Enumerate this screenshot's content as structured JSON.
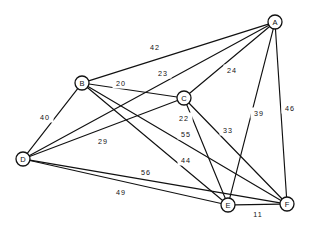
{
  "chart_data": {
    "type": "diagram",
    "title": "",
    "subtitle": "",
    "xlabel": "",
    "ylabel": "",
    "graph_kind": "undirected-weighted-graph",
    "colors": {
      "background": "#ffffff",
      "stroke": "#111111",
      "node_fill": "#ffffff",
      "text": "#111111"
    },
    "nodes": [
      {
        "id": "A",
        "label": "A",
        "x": 275,
        "y": 22,
        "r": 7
      },
      {
        "id": "B",
        "label": "B",
        "x": 82,
        "y": 83,
        "r": 7
      },
      {
        "id": "C",
        "label": "C",
        "x": 184,
        "y": 98,
        "r": 7
      },
      {
        "id": "D",
        "label": "D",
        "x": 23,
        "y": 159,
        "r": 7
      },
      {
        "id": "E",
        "label": "E",
        "x": 228,
        "y": 205,
        "r": 7
      },
      {
        "id": "F",
        "label": "F",
        "x": 287,
        "y": 204,
        "r": 7
      }
    ],
    "edges": [
      {
        "id": "AB",
        "from": "B",
        "to": "A",
        "weight": "42",
        "label_x": 155,
        "label_y": 47
      },
      {
        "id": "AD",
        "from": "D",
        "to": "A",
        "weight": "23",
        "label_x": 163,
        "label_y": 73
      },
      {
        "id": "BC",
        "from": "B",
        "to": "C",
        "weight": "20",
        "label_x": 121,
        "label_y": 83
      },
      {
        "id": "AC",
        "from": "C",
        "to": "A",
        "weight": "24",
        "label_x": 232,
        "label_y": 70
      },
      {
        "id": "BD",
        "from": "B",
        "to": "D",
        "weight": "40",
        "label_x": 45,
        "label_y": 117
      },
      {
        "id": "CE",
        "from": "C",
        "to": "E",
        "weight": "22",
        "label_x": 184,
        "label_y": 118
      },
      {
        "id": "CF",
        "from": "C",
        "to": "F",
        "weight": "33",
        "label_x": 228,
        "label_y": 130
      },
      {
        "id": "AE",
        "from": "A",
        "to": "E",
        "weight": "39",
        "label_x": 259,
        "label_y": 113
      },
      {
        "id": "AF",
        "from": "A",
        "to": "F",
        "weight": "46",
        "label_x": 290,
        "label_y": 108
      },
      {
        "id": "BF",
        "from": "B",
        "to": "F",
        "weight": "29",
        "label_x": 103,
        "label_y": 141
      },
      {
        "id": "DC",
        "from": "D",
        "to": "C",
        "weight": "55",
        "label_x": 186,
        "label_y": 134
      },
      {
        "id": "BE",
        "from": "B",
        "to": "E",
        "weight": "44",
        "label_x": 186,
        "label_y": 160
      },
      {
        "id": "DF",
        "from": "D",
        "to": "F",
        "weight": "56",
        "label_x": 146,
        "label_y": 172
      },
      {
        "id": "DE",
        "from": "D",
        "to": "E",
        "weight": "49",
        "label_x": 121,
        "label_y": 192
      },
      {
        "id": "EF",
        "from": "E",
        "to": "F",
        "weight": "11",
        "label_x": 258,
        "label_y": 214
      }
    ]
  }
}
